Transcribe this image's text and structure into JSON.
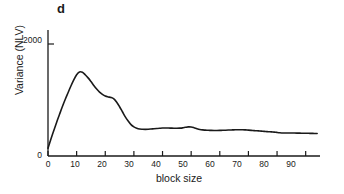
{
  "figure": {
    "panel_label": "d",
    "background_color": "#ffffff",
    "ink_color": "#1a1a1a"
  },
  "chart_data": {
    "type": "line",
    "title": "",
    "subtitle": "",
    "panel": "d",
    "xlabel": "block size",
    "ylabel": "Variance (NLV)",
    "xlim": [
      0,
      95
    ],
    "ylim": [
      0,
      2250
    ],
    "xticks": [
      0,
      10,
      20,
      30,
      40,
      50,
      60,
      70,
      80,
      90
    ],
    "xtick_labels": [
      "0",
      "10",
      "20",
      "30",
      "40",
      "50",
      "60",
      "70",
      "80",
      "90"
    ],
    "yticks": [
      0,
      2000
    ],
    "ytick_labels": [
      "0",
      "2000"
    ],
    "grid": false,
    "legend": null,
    "legend_position": "none",
    "annotations": [],
    "series": [
      {
        "name": "variance",
        "color": "#1a1a1a",
        "line_width": 1.6,
        "x": [
          0,
          1,
          2,
          3,
          4,
          5,
          6,
          7,
          8,
          9,
          10,
          11,
          12,
          13,
          14,
          15,
          16,
          17,
          18,
          19,
          20,
          21,
          22,
          23,
          24,
          25,
          26,
          27,
          28,
          29,
          30,
          31,
          32,
          33,
          34,
          35,
          36,
          37,
          38,
          39,
          40,
          41,
          42,
          43,
          44,
          45,
          46,
          47,
          48,
          49,
          50,
          51,
          52,
          53,
          54,
          55,
          56,
          57,
          58,
          59,
          60,
          61,
          62,
          63,
          64,
          65,
          66,
          67,
          68,
          69,
          70,
          71,
          72,
          73,
          74,
          75,
          76,
          77,
          78,
          79,
          80,
          81,
          82,
          83,
          84,
          85,
          86,
          87,
          88,
          89,
          90,
          91,
          92,
          93,
          94
        ],
        "y": [
          140,
          300,
          450,
          600,
          740,
          880,
          1010,
          1130,
          1250,
          1360,
          1450,
          1500,
          1495,
          1450,
          1395,
          1330,
          1260,
          1195,
          1140,
          1100,
          1070,
          1055,
          1045,
          1020,
          960,
          880,
          790,
          700,
          625,
          560,
          520,
          495,
          482,
          478,
          476,
          478,
          482,
          487,
          492,
          496,
          499,
          500,
          500,
          498,
          496,
          495,
          497,
          502,
          512,
          520,
          518,
          505,
          488,
          474,
          466,
          462,
          459,
          457,
          456,
          456,
          457,
          459,
          461,
          463,
          465,
          467,
          469,
          470,
          469,
          466,
          462,
          458,
          454,
          450,
          446,
          442,
          438,
          434,
          430,
          426,
          421,
          416,
          412,
          411,
          411,
          411,
          410,
          409,
          408,
          407,
          406,
          405,
          404,
          403,
          402
        ]
      }
    ]
  },
  "axis": {
    "y_title": "Variance (NLV)",
    "x_title": "block size",
    "y_tick_0": "0",
    "y_tick_2000": "2000",
    "x_tick_0": "0",
    "x_tick_10": "10",
    "x_tick_20": "20",
    "x_tick_30": "30",
    "x_tick_40": "40",
    "x_tick_50": "50",
    "x_tick_60": "60",
    "x_tick_70": "70",
    "x_tick_80": "80",
    "x_tick_90": "90"
  }
}
